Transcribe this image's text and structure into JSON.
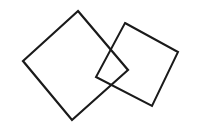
{
  "figure": {
    "width": 198,
    "height": 132,
    "background_color": "#ffffff",
    "stroke_color": "#1a1a1a",
    "stroke_width": 2.1,
    "shapes": [
      {
        "name": "left-square",
        "label": "Large rotated square (left)",
        "stroke_color": "#1a1a1a",
        "stroke_width": 2.2,
        "points": "78,11 128,70 72,120 23,61",
        "vertices": [
          {
            "role": "top",
            "x": 78,
            "y": 11
          },
          {
            "role": "right",
            "x": 128,
            "y": 70
          },
          {
            "role": "bottom",
            "x": 72,
            "y": 120
          },
          {
            "role": "left",
            "x": 23,
            "y": 61
          }
        ],
        "side_length": 77,
        "rotation_degrees": 44
      },
      {
        "name": "right-square",
        "label": "Smaller rotated square (right)",
        "stroke_color": "#1a1a1a",
        "stroke_width": 2.0,
        "points": "125,23 178,52 152,106 96,77",
        "vertices": [
          {
            "role": "top",
            "x": 125,
            "y": 23
          },
          {
            "role": "right",
            "x": 178,
            "y": 52
          },
          {
            "role": "bottom",
            "x": 152,
            "y": 106
          },
          {
            "role": "left",
            "x": 96,
            "y": 77
          }
        ],
        "side_length": 61,
        "rotation_degrees": 29
      }
    ]
  }
}
